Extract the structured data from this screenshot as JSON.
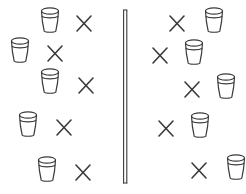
{
  "figure": {
    "type": "comparison-diagram",
    "stroke_color": "#3a3a3a",
    "background_color": "#ffffff",
    "width": 246,
    "height": 194
  },
  "divider": {
    "name": "vertical-bar",
    "x": 122,
    "y_top": 9,
    "y_bottom": 183,
    "width": 6
  },
  "left_group": {
    "label": "left-column",
    "order": "cup-then-x",
    "count": 5,
    "rows": [
      {
        "cup_x": 36,
        "cup_y": 6,
        "x_x": 70,
        "x_y": 8
      },
      {
        "cup_x": 6,
        "cup_y": 36,
        "x_x": 41,
        "x_y": 38
      },
      {
        "cup_x": 36,
        "cup_y": 67,
        "x_x": 72,
        "x_y": 70
      },
      {
        "cup_x": 14,
        "cup_y": 110,
        "x_x": 50,
        "x_y": 112
      },
      {
        "cup_x": 33,
        "cup_y": 155,
        "x_x": 69,
        "x_y": 157
      }
    ]
  },
  "right_group": {
    "label": "right-column",
    "order": "x-then-cup",
    "count": 5,
    "rows": [
      {
        "x_x": 163,
        "x_y": 8,
        "cup_x": 200,
        "cup_y": 6
      },
      {
        "x_x": 146,
        "x_y": 40,
        "cup_x": 180,
        "cup_y": 38
      },
      {
        "x_x": 178,
        "x_y": 74,
        "cup_x": 212,
        "cup_y": 72
      },
      {
        "x_x": 152,
        "x_y": 113,
        "cup_x": 186,
        "cup_y": 111
      },
      {
        "x_x": 185,
        "x_y": 155,
        "cup_x": 222,
        "cup_y": 153
      }
    ]
  },
  "glyphs": {
    "cup": "cup-icon",
    "cross": "x-mark-icon",
    "bar": "vertical-bar-icon"
  }
}
